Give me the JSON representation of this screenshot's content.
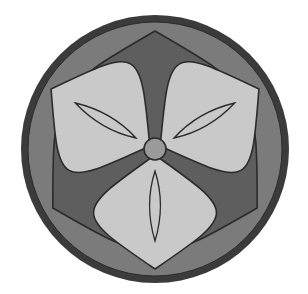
{
  "image": {
    "kind": "circular-emblem",
    "subject": "three-petal floral crest",
    "width": 308,
    "height": 294,
    "background_color": "#ffffff"
  },
  "palette": {
    "outer_ring": "#3b3b3b",
    "disc_background": "#7b7b7b",
    "dark_petal": "#5e5e5e",
    "light_petal": "#c9c9c9",
    "center_hub": "#9a9a9a",
    "outline": "#2b2b2b",
    "inner_leaf_fill": "#c9c9c9"
  },
  "geometry": {
    "center_x": 155,
    "center_y": 149,
    "outer_radius": 134,
    "ring_thickness": 7,
    "disc_radius": 127,
    "hub_radius": 11,
    "dark_petal_count": 3,
    "light_petal_count": 3,
    "dark_petal_angles": [
      -90,
      30,
      150
    ],
    "light_petal_angles": [
      -150,
      -30,
      90
    ],
    "dark_petal_tip_radius": 118,
    "light_petal_tip_radius": 120,
    "inner_leaf_start_radius": 22,
    "inner_leaf_tip_radius": 92
  },
  "labels": {
    "title": "Circular floral crest emblem",
    "center": "center hub",
    "dark_petal": "dark petal",
    "light_petal": "light petal",
    "inner_leaf": "inner leaf vein",
    "outer_ring": "outer ring",
    "disc": "disc background"
  },
  "chart_data": {
    "type": "pie",
    "title": "Circular floral crest emblem",
    "categories": [
      "dark petal",
      "light petal",
      "disc background"
    ],
    "values": [
      3,
      3,
      1
    ],
    "xlabel": "",
    "ylabel": "",
    "legend": "none",
    "grid": false
  }
}
